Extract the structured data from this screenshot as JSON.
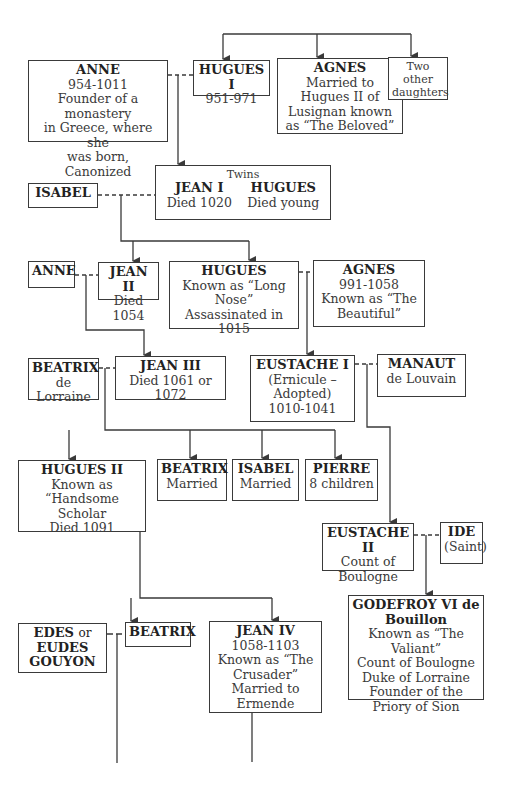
{
  "diagram": {
    "type": "family-tree",
    "people": {
      "anne_954": {
        "name": "ANNE",
        "lines": [
          "954-1011",
          "Founder of a monastery",
          "in Greece, where she",
          "was born, Canonized"
        ]
      },
      "hugues_i": {
        "name": "HUGUES I",
        "lines": [
          "951-971"
        ]
      },
      "agnes_beloved": {
        "name": "AGNES",
        "lines": [
          "Married to",
          "Hugues II of",
          "Lusignan known",
          "as “The Beloved”"
        ]
      },
      "two_daughters": {
        "name": "",
        "lines": [
          "Two other",
          "daughters"
        ]
      },
      "twins": {
        "label": "Twins",
        "jean_i": {
          "name": "JEAN I",
          "lines": [
            "Died 1020"
          ]
        },
        "hugues": {
          "name": "HUGUES",
          "lines": [
            "Died young"
          ]
        }
      },
      "isabel_spouse": {
        "name": "ISABEL",
        "lines": []
      },
      "anne_spouse": {
        "name": "ANNE",
        "lines": []
      },
      "jean_ii": {
        "name": "JEAN II",
        "lines": [
          "Died 1054"
        ]
      },
      "hugues_long_nose": {
        "name": "HUGUES",
        "lines": [
          "Known as “Long",
          "Nose”",
          "Assassinated in 1015"
        ]
      },
      "agnes_beautiful": {
        "name": "AGNES",
        "lines": [
          "991-1058",
          "Known as “The",
          "Beautiful”"
        ]
      },
      "beatrix_lorraine": {
        "name": "BEATRIX",
        "lines": [
          "de Lorraine"
        ]
      },
      "jean_iii": {
        "name": "JEAN III",
        "lines": [
          "Died 1061 or 1072"
        ]
      },
      "eustache_i": {
        "name": "EUSTACHE I",
        "lines": [
          "(Ernicule –",
          "Adopted)",
          "1010-1041"
        ]
      },
      "manaut": {
        "name": "MANAUT",
        "lines": [
          "de Louvain"
        ]
      },
      "hugues_ii": {
        "name": "HUGUES II",
        "lines": [
          "Known as",
          "“Handsome Scholar",
          "Died 1091"
        ]
      },
      "beatrix_married": {
        "name": "BEATRIX",
        "lines": [
          "Married"
        ]
      },
      "isabel_married": {
        "name": "ISABEL",
        "lines": [
          "Married"
        ]
      },
      "pierre": {
        "name": "PIERRE",
        "lines": [
          "8 children"
        ]
      },
      "eustache_ii": {
        "name": "EUSTACHE II",
        "lines": [
          "Count of",
          "Boulogne"
        ]
      },
      "ide": {
        "name": "IDE",
        "lines": [
          "(Saint)"
        ]
      },
      "godefroy": {
        "name": "GODEFROY VI de",
        "name2": "Bouillon",
        "lines": [
          "Known as “The Valiant”",
          "Count of Boulogne",
          "Duke of Lorraine",
          "Founder of the",
          "Priory of Sion"
        ]
      },
      "edes": {
        "name": "EDES",
        "or": "or",
        "name2": "EUDES",
        "name3": "GOUYON"
      },
      "beatrix_bottom": {
        "name": "BEATRIX",
        "lines": []
      },
      "jean_iv": {
        "name": "JEAN IV",
        "lines": [
          "1058-1103",
          "Known as “The",
          "Crusader”",
          "Married to",
          "Ermende"
        ]
      }
    },
    "colors": {
      "line": "#3a3a3a",
      "text": "#2a2a2a",
      "background": "#ffffff"
    }
  }
}
